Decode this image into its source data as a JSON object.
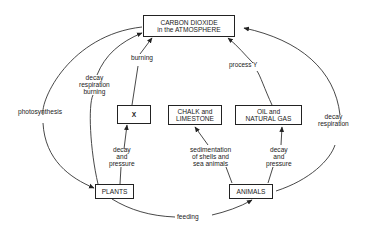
{
  "diagram": {
    "type": "carbon-cycle",
    "nodes": {
      "co2": {
        "line1": "CARBON DIOXIDE",
        "line2": "in the ATMOSPHERE"
      },
      "x": {
        "label": "X"
      },
      "chalk": {
        "line1": "CHALK and",
        "line2": "LIMESTONE"
      },
      "oil": {
        "line1": "OIL and",
        "line2": "NATURAL GAS"
      },
      "plants": {
        "label": "PLANTS"
      },
      "animals": {
        "label": "ANIMALS"
      }
    },
    "edges": {
      "photosynthesis": {
        "label": "photosynthesis"
      },
      "plants_to_co2": {
        "line1": "decay",
        "line2": "respiration",
        "line3": "burning"
      },
      "x_burning": {
        "label": "burning"
      },
      "plants_to_x": {
        "line1": "decay",
        "line2": "and",
        "line3": "pressure"
      },
      "sedimentation": {
        "line1": "sedimentation",
        "line2": "of shells and",
        "line3": "sea animals"
      },
      "animals_to_oil": {
        "line1": "decay",
        "line2": "and",
        "line3": "pressure"
      },
      "process_y": {
        "label": "process Y"
      },
      "animals_to_co2": {
        "line1": "decay",
        "line2": "respiration"
      },
      "feeding": {
        "label": "feeding"
      }
    }
  }
}
